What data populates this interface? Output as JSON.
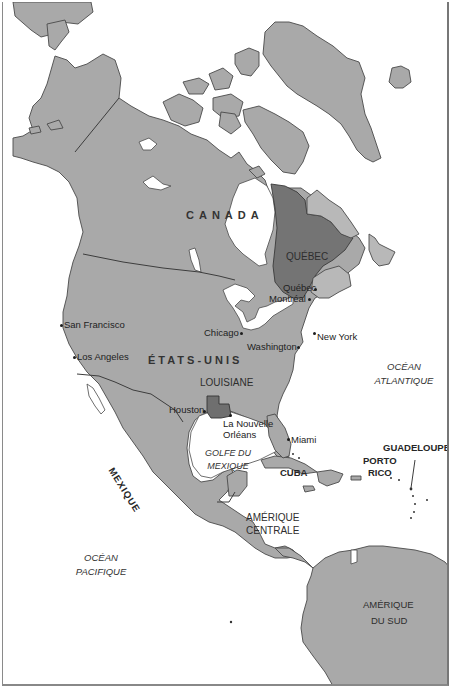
{
  "map": {
    "title": "",
    "colors": {
      "land": "#a9a9a9",
      "highlight_quebec": "#747474",
      "highlight_louisiane": "#6f6f6f",
      "water": "#ffffff",
      "outline": "#4a4a4a"
    },
    "countries": {
      "canada": "CANADA",
      "usa": "ÉTATS-UNIS",
      "mexique": "MEXIQUE"
    },
    "regions": {
      "quebec": "QUÉBEC",
      "louisiane": "LOUISIANE",
      "amerique_centrale_1": "AMÉRIQUE",
      "amerique_centrale_2": "CENTRALE",
      "amerique_sud_1": "AMÉRIQUE",
      "amerique_sud_2": "DU SUD",
      "cuba": "CUBA",
      "porto_rico_1": "PORTO",
      "porto_rico_2": "RICO",
      "guadeloupe": "GUADELOUPE"
    },
    "oceans": {
      "atlantique_1": "OCÉAN",
      "atlantique_2": "ATLANTIQUE",
      "pacifique_1": "OCÉAN",
      "pacifique_2": "PACIFIQUE",
      "golfe_1": "GOLFE DU",
      "golfe_2": "MEXIQUE"
    },
    "cities": {
      "san_francisco": "San Francisco",
      "los_angeles": "Los Angeles",
      "chicago": "Chicago",
      "washington": "Washington",
      "new_york": "New York",
      "quebec": "Québec",
      "montreal": "Montréal",
      "houston": "Houston",
      "nouvelle_orleans_1": "La Nouvelle",
      "nouvelle_orleans_2": "Orléans",
      "miami": "Miami"
    }
  }
}
